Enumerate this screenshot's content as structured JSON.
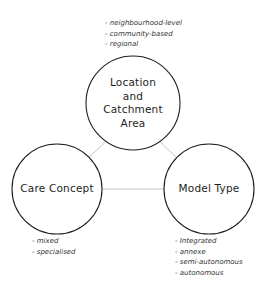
{
  "diagram": {
    "type": "triangle-of-circles",
    "edge_color": "#c8c8c8",
    "circle_stroke": "#1e1e1e",
    "nodes": [
      {
        "id": "location",
        "label_lines": [
          "Location",
          "and",
          "Catchment",
          "Area"
        ],
        "attributes": [
          "neighbourhood-level",
          "community-based",
          "regional"
        ]
      },
      {
        "id": "care",
        "label_lines": [
          "Care Concept"
        ],
        "attributes": [
          "mixed",
          "specialised"
        ]
      },
      {
        "id": "model",
        "label_lines": [
          "Model Type"
        ],
        "attributes": [
          "Integrated",
          "annexe",
          "semi-autonomous",
          "autonomous"
        ]
      }
    ],
    "edges": [
      {
        "from": "location",
        "to": "care"
      },
      {
        "from": "location",
        "to": "model"
      },
      {
        "from": "care",
        "to": "model"
      }
    ]
  }
}
